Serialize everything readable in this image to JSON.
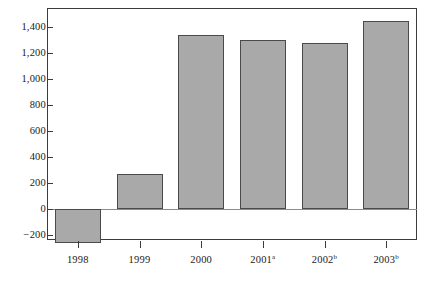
{
  "chart_data": {
    "type": "bar",
    "title": "",
    "subtitle": "",
    "xlabel": "",
    "ylabel": "",
    "categories": [
      "1998",
      "1999",
      "2000",
      "2001",
      "2002",
      "2003"
    ],
    "category_superscripts": [
      "",
      "",
      "",
      "a",
      "b",
      "b"
    ],
    "values": [
      -260,
      270,
      1340,
      1300,
      1280,
      1450
    ],
    "series": [
      {
        "name": "",
        "values": [
          -260,
          270,
          1340,
          1300,
          1280,
          1450
        ]
      }
    ],
    "ylim": [
      -400,
      1530
    ],
    "ytick_values": [
      -200,
      0,
      200,
      400,
      600,
      800,
      1000,
      1200,
      1400
    ],
    "ytick_labels": [
      "−200",
      "0",
      "200",
      "400",
      "600",
      "800",
      "1,000",
      "1,200",
      "1,400"
    ],
    "grid": false,
    "legend": null,
    "legend_position": "none",
    "annotations": [],
    "colors": {
      "bar_fill": "#a9a9a9",
      "bar_border": "#4a4a4a",
      "axis": "#3b3b3b",
      "zero_line": "#8d8d8d",
      "background": "#ffffff",
      "text": "#1a1a1a"
    }
  }
}
